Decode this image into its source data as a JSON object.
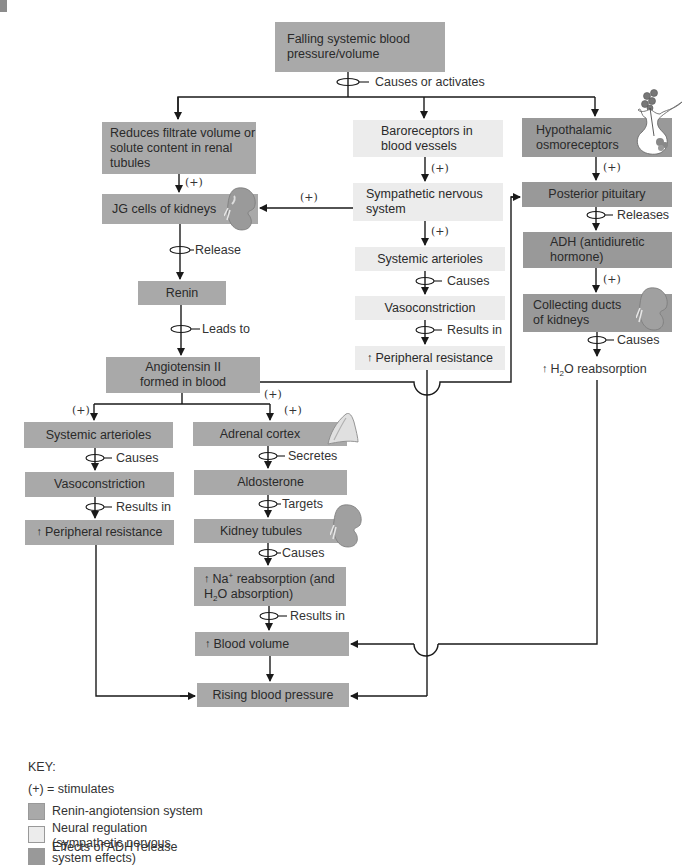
{
  "colors": {
    "renin_angiotensin": "#a9a9a9",
    "neural_regulation": "#ececec",
    "adh_effects": "#999999",
    "line": "#1a1a1a"
  },
  "top": {
    "title": "Falling systemic blood pressure/volume",
    "connector": "Causes or activates"
  },
  "left_branch": {
    "reduces": "Reduces filtrate volume or solute content in renal tubules",
    "plus1": "(+)",
    "jg_cells": "JG cells of kidneys",
    "release": "Release",
    "renin": "Renin",
    "leads_to": "Leads to",
    "angiotensin": "Angiotensin II formed in blood"
  },
  "middle_branch": {
    "baroreceptors": "Baroreceptors in blood vessels",
    "plus1": "(+)",
    "sympathetic": "Sympathetic nervous system",
    "plus_to_jg": "(+)",
    "plus2": "(+)",
    "arterioles": "Systemic arterioles",
    "causes": "Causes",
    "vasoconstriction": "Vasoconstriction",
    "results_in": "Results in",
    "resistance": "Peripheral resistance"
  },
  "right_branch": {
    "osmoreceptors": "Hypothalamic osmoreceptors",
    "plus1": "(+)",
    "pituitary": "Posterior pituitary",
    "releases": "Releases",
    "adh": "ADH (antidiuretic hormone)",
    "plus2": "(+)",
    "collecting": "Collecting ducts of kidneys",
    "causes": "Causes",
    "h2o_pre": "H",
    "h2o_sub": "2",
    "h2o_post": "O reabsorption"
  },
  "lower_left": {
    "plus": "(+)",
    "arterioles": "Systemic arterioles",
    "causes": "Causes",
    "vasoconstriction": "Vasoconstriction",
    "results_in": "Results in",
    "resistance": "Peripheral resistance"
  },
  "lower_middle": {
    "plus_a": "(+)",
    "plus_b": "(+)",
    "adrenal": "Adrenal cortex",
    "secretes": "Secretes",
    "aldosterone": "Aldosterone",
    "targets": "Targets",
    "tubules": "Kidney tubules",
    "causes": "Causes",
    "na_pre": "Na",
    "na_sup": "+",
    "na_post": " reabsorption (and",
    "na_line2_pre": "H",
    "na_line2_sub": "2",
    "na_line2_post": "O absorption)",
    "results_in": "Results in",
    "blood_volume": "Blood volume",
    "rising": "Rising blood pressure"
  },
  "key": {
    "title": "KEY:",
    "plus_def": "(+) = stimulates",
    "items": [
      {
        "label": "Renin-angiotension system"
      },
      {
        "label": "Neural regulation (sympathetic nervous system effects)"
      },
      {
        "label": "Effects of ADH release"
      }
    ]
  }
}
